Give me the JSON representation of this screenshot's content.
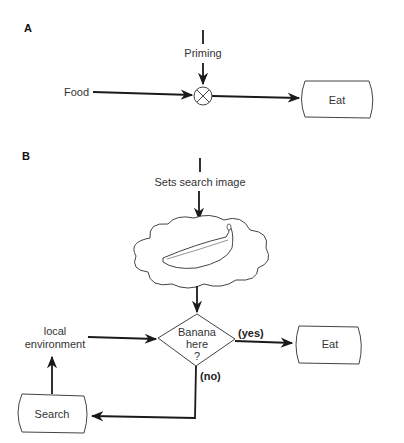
{
  "panel_a": {
    "label": "A",
    "priming": "Priming",
    "food": "Food",
    "junction_icon": "multiplier-junction-icon",
    "eat": "Eat"
  },
  "panel_b": {
    "label": "B",
    "sets_search_image": "Sets search image",
    "cloud_icon": "thought-cloud-banana-icon",
    "decision": [
      "Banana",
      "here",
      "?"
    ],
    "yes": "(yes)",
    "no": "(no)",
    "eat": "Eat",
    "local_environment": [
      "local",
      "environment"
    ],
    "search": "Search"
  }
}
